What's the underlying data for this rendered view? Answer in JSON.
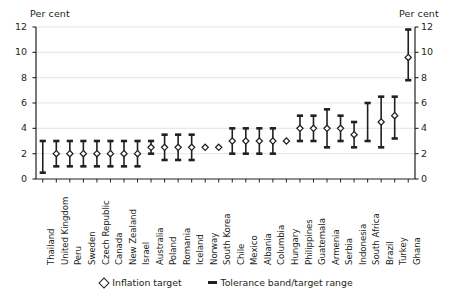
{
  "axis": {
    "unit_left": "Per cent",
    "unit_right": "Per cent",
    "yticks": [
      0,
      2,
      4,
      6,
      8,
      10,
      12
    ]
  },
  "legend": {
    "items": [
      {
        "marker": "diamond-marker",
        "label": "Inflation target"
      },
      {
        "marker": "bar-marker",
        "label": "Tolerance band/target range"
      }
    ]
  },
  "chart_data": {
    "type": "scatter",
    "title": "",
    "xlabel": "",
    "ylabel": "Per cent",
    "ylim": [
      0,
      12
    ],
    "grid": true,
    "legend_position": "bottom",
    "categories": [
      "Thailand",
      "United Kingdom",
      "Peru",
      "Sweden",
      "Czech Republic",
      "Canada",
      "New Zealand",
      "Israel",
      "Australia",
      "Poland",
      "Romania",
      "Iceland",
      "Norway",
      "South Korea",
      "Chile",
      "Mexico",
      "Albania",
      "Columbia",
      "Hungary",
      "Philippines",
      "Guatemala",
      "Armenia",
      "Serbia",
      "Indonesia",
      "South Africa",
      "Brazil",
      "Turkey",
      "Ghana"
    ],
    "series": [
      {
        "name": "Inflation target",
        "values": [
          null,
          2.0,
          2.0,
          2.0,
          2.0,
          2.0,
          2.0,
          2.0,
          2.5,
          2.5,
          2.5,
          2.5,
          2.5,
          2.5,
          3.0,
          3.0,
          3.0,
          3.0,
          3.0,
          4.0,
          4.0,
          4.0,
          4.0,
          3.5,
          null,
          4.5,
          5.0,
          9.6
        ]
      },
      {
        "name": "Tolerance band/target range lower",
        "values": [
          0.5,
          1.0,
          1.0,
          1.0,
          1.0,
          1.0,
          1.0,
          1.0,
          2.0,
          1.5,
          1.5,
          1.5,
          null,
          null,
          2.0,
          2.0,
          2.0,
          2.0,
          null,
          3.0,
          3.0,
          2.5,
          3.0,
          2.5,
          3.0,
          2.5,
          3.2,
          7.8
        ]
      },
      {
        "name": "Tolerance band/target range upper",
        "values": [
          3.0,
          3.0,
          3.0,
          3.0,
          3.0,
          3.0,
          3.0,
          3.0,
          3.0,
          3.5,
          3.5,
          3.5,
          null,
          null,
          4.0,
          4.0,
          4.0,
          4.0,
          null,
          5.0,
          5.0,
          5.5,
          5.0,
          4.5,
          6.0,
          6.5,
          6.5,
          11.8
        ]
      }
    ]
  }
}
